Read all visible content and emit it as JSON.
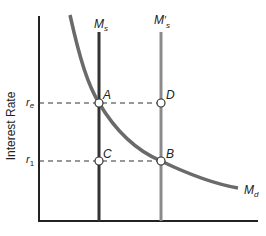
{
  "diagram": {
    "y_axis_label": "Interest Rate",
    "ticks": {
      "re": {
        "base": "r",
        "sub": "e"
      },
      "r1": {
        "base": "r",
        "sub": "1"
      }
    },
    "curves": {
      "ms": {
        "base": "M",
        "sub": "s"
      },
      "ms_prime": {
        "base": "M",
        "prime": "′",
        "sub": "s"
      },
      "md": {
        "base": "M",
        "sub": "d"
      }
    },
    "points": {
      "A": "A",
      "B": "B",
      "C": "C",
      "D": "D"
    },
    "colors": {
      "axis": "#222222",
      "ms": "#333333",
      "ms_prime": "#8a8a8a",
      "md": "#6a6a6a",
      "dashed": "#333333"
    }
  }
}
